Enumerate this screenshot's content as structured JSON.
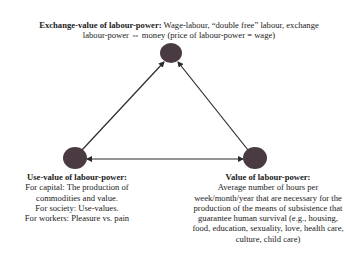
{
  "diagram": {
    "node_color": "#4a3b42",
    "edge_color": "#2a2a2a",
    "nodes": [
      {
        "id": "exchange-value",
        "x": 171,
        "y": 53,
        "r": 10
      },
      {
        "id": "use-value",
        "x": 75,
        "y": 158,
        "r": 11
      },
      {
        "id": "value",
        "x": 255,
        "y": 158,
        "r": 11
      }
    ],
    "edges": [
      {
        "from": "use-value",
        "to": "exchange-value",
        "direction": "to"
      },
      {
        "from": "value",
        "to": "exchange-value",
        "direction": "to"
      },
      {
        "from": "use-value",
        "to": "value",
        "direction": "both"
      }
    ]
  },
  "top_node": {
    "title": "Exchange-value of labour-power:",
    "line1": " Wage-labour, “double free” labour, exchange",
    "line2": "labour-power ⇔ money (price of labour-power = wage)"
  },
  "left_node": {
    "title": "Use-value of labour-power:",
    "lines": [
      "For capital: The production of",
      "commodities and value.",
      "For society: Use-values.",
      "For workers: Pleasure vs. pain"
    ]
  },
  "right_node": {
    "title": "Value of labour-power:",
    "lines": [
      "Average number of hours per",
      "week/month/year that are necessary for the",
      "production of the means of subsistence that",
      "guarantee human survival  (e.g., housing,",
      "food, education, sexuality, love, health care,",
      "culture, child care)"
    ]
  }
}
